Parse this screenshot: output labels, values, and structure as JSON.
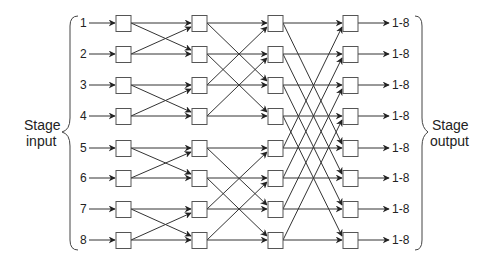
{
  "diagram": {
    "type": "butterfly-switching-network",
    "left_label": [
      "Stage",
      "input"
    ],
    "right_label": [
      "Stage",
      "output"
    ],
    "inputs": [
      "1",
      "2",
      "3",
      "4",
      "5",
      "6",
      "7",
      "8"
    ],
    "outputs": [
      "1-8",
      "1-8",
      "1-8",
      "1-8",
      "1-8",
      "1-8",
      "1-8",
      "1-8"
    ],
    "stages": 4,
    "rows_y": [
      23,
      54,
      85,
      116,
      148,
      178,
      209,
      240
    ],
    "columns_x": [
      116,
      192,
      268,
      343
    ],
    "box_size": 15,
    "stage_connections": [
      {
        "from_stage": 1,
        "to_stage": 2,
        "cross_distance": 1
      },
      {
        "from_stage": 2,
        "to_stage": 3,
        "cross_distance": 2
      },
      {
        "from_stage": 3,
        "to_stage": 4,
        "cross_distance": 4
      }
    ],
    "colors": {
      "line": "#333333",
      "box_border": "#555555",
      "text": "#222222"
    }
  }
}
